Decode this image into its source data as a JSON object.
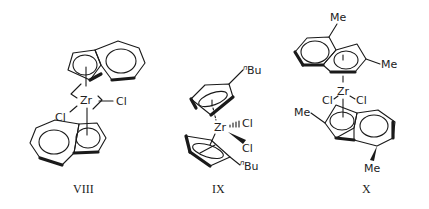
{
  "figure": {
    "compounds": [
      {
        "id": "VIII",
        "label": "VIII",
        "metal": "Zr",
        "ligands": [
          "Cl",
          "Cl"
        ],
        "description": "ethylene-bridged bis(indenyl) zirconium dichloride"
      },
      {
        "id": "IX",
        "label": "IX",
        "metal": "Zr",
        "ligands": [
          "Cl",
          "Cl"
        ],
        "substituents": [
          "nBu",
          "nBu"
        ],
        "description": "bis(n-butylcyclopentadienyl) zirconium dichloride"
      },
      {
        "id": "X",
        "label": "X",
        "metal": "Zr",
        "ligands": [
          "Cl",
          "Cl"
        ],
        "substituents": [
          "Me",
          "Me",
          "Me",
          "Me"
        ],
        "description": "bis(2,4-dimethylindenyl) zirconium dichloride"
      }
    ],
    "atoms": {
      "zr": "Zr",
      "cl": "Cl",
      "me": "Me",
      "bu_sup": "n",
      "bu": "Bu"
    }
  }
}
